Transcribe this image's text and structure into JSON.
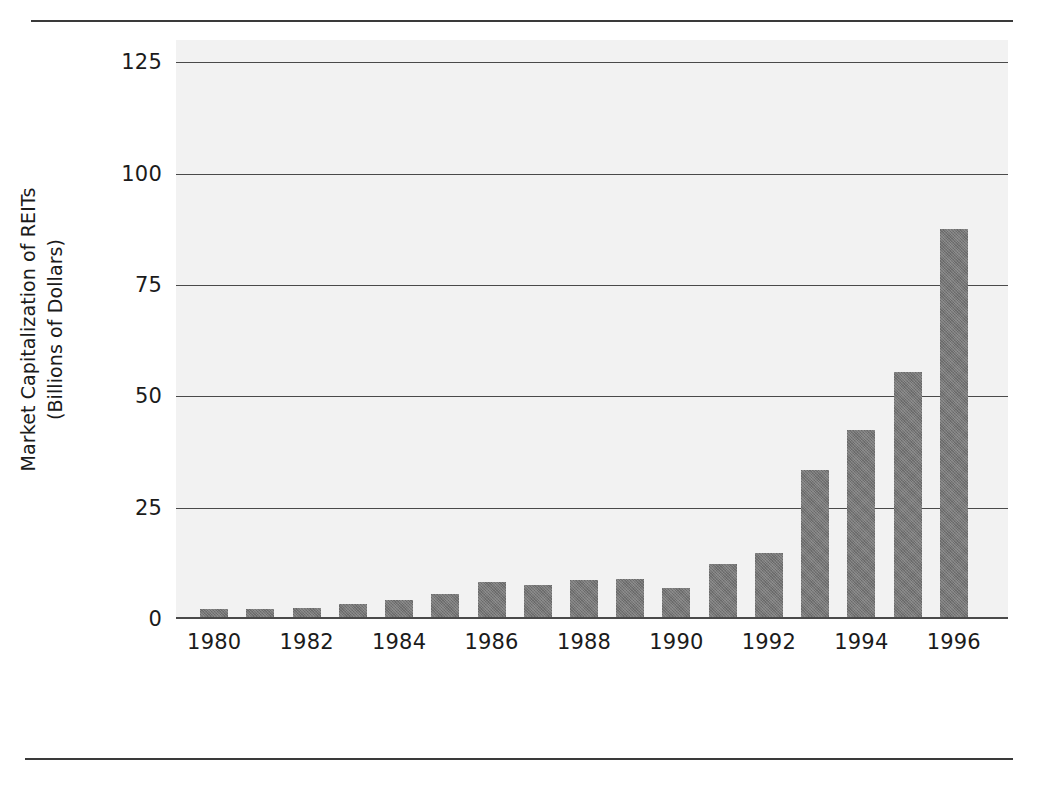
{
  "chart_data": {
    "type": "bar",
    "title": "",
    "xlabel": "",
    "ylabel_lines": [
      "Market Capitalization of REITs",
      "(Billions of Dollars)"
    ],
    "ylabel": "Market Capitalization of REITs (Billions of Dollars)",
    "categories": [
      1980,
      1981,
      1982,
      1983,
      1984,
      1985,
      1986,
      1987,
      1988,
      1989,
      1990,
      1991,
      1992,
      1993,
      1994,
      1995,
      1996
    ],
    "values": [
      2.3,
      2.2,
      2.5,
      3.4,
      4.3,
      5.7,
      8.3,
      7.6,
      8.8,
      8.9,
      6.9,
      12.4,
      14.8,
      33.4,
      42.5,
      55.5,
      87.5
    ],
    "ytick_labels": [
      "125",
      "100",
      "75",
      "50",
      "25",
      "0"
    ],
    "ytick_values": [
      125,
      100,
      75,
      50,
      25,
      0
    ],
    "xtick_labels": [
      "1980",
      "1982",
      "1984",
      "1986",
      "1988",
      "1990",
      "1992",
      "1994",
      "1996"
    ],
    "xtick_values": [
      1980,
      1982,
      1984,
      1986,
      1988,
      1990,
      1992,
      1994,
      1996
    ],
    "ylim": [
      0,
      130
    ],
    "grid": "horizontal",
    "legend": "none",
    "bar_color": "#767676",
    "plot_background": "#f2f2f2",
    "axis_color": "#4a4a4a",
    "text_color": "#1b1b1b"
  }
}
